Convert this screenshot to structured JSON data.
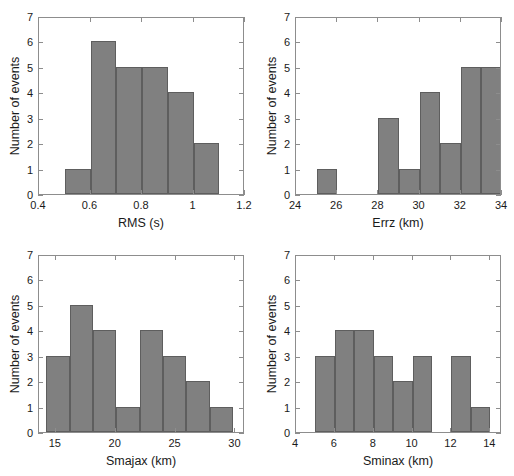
{
  "figure": {
    "name": "four-panel-histogram-figure",
    "background": "#ffffff",
    "bar_fill": "#808080",
    "bar_edge": "#5e5e5e",
    "axis_color": "#8d8d8d",
    "text_color": "#1a1a1a"
  },
  "chart_data": [
    {
      "type": "bar",
      "panel": "top-left",
      "title": "",
      "xlabel": "RMS (s)",
      "ylabel": "Number of events",
      "xlim": [
        0.4,
        1.2
      ],
      "ylim": [
        0,
        7
      ],
      "grid": false,
      "legend": "none",
      "xticks": [
        0.4,
        0.6,
        0.8,
        1,
        1.2
      ],
      "xticklabels": [
        "0.4",
        "0.6",
        "0.8",
        "1",
        "1.2"
      ],
      "yticks": [
        0,
        1,
        2,
        3,
        4,
        5,
        6,
        7
      ],
      "yticklabels": [
        "0",
        "1",
        "2",
        "3",
        "4",
        "5",
        "6",
        "7"
      ],
      "bin_edges": [
        0.5,
        0.6,
        0.7,
        0.8,
        0.9,
        1.0,
        1.1
      ],
      "bin_centers": [
        0.55,
        0.65,
        0.75,
        0.85,
        0.95,
        1.05
      ],
      "values": [
        1,
        6,
        5,
        5,
        4,
        2
      ]
    },
    {
      "type": "bar",
      "panel": "top-right",
      "title": "",
      "xlabel": "Errz (km)",
      "ylabel": "Number of events",
      "xlim": [
        24,
        34
      ],
      "ylim": [
        0,
        7
      ],
      "grid": false,
      "legend": "none",
      "xticks": [
        24,
        26,
        28,
        30,
        32,
        34
      ],
      "xticklabels": [
        "24",
        "26",
        "28",
        "30",
        "32",
        "34"
      ],
      "yticks": [
        0,
        1,
        2,
        3,
        4,
        5,
        6,
        7
      ],
      "yticklabels": [
        "0",
        "1",
        "2",
        "3",
        "4",
        "5",
        "6",
        "7"
      ],
      "bars": [
        {
          "x0": 25,
          "x1": 26,
          "value": 1
        },
        {
          "x0": 28,
          "x1": 29,
          "value": 3
        },
        {
          "x0": 29,
          "x1": 30,
          "value": 1
        },
        {
          "x0": 30,
          "x1": 31,
          "value": 4
        },
        {
          "x0": 31,
          "x1": 32,
          "value": 2
        },
        {
          "x0": 32,
          "x1": 33,
          "value": 5
        },
        {
          "x0": 33,
          "x1": 34,
          "value": 5
        }
      ]
    },
    {
      "type": "bar",
      "panel": "bottom-left",
      "title": "",
      "xlabel": "Smajax (km)",
      "ylabel": "Number of events",
      "xlim": [
        13.6,
        30.8
      ],
      "ylim": [
        0,
        7
      ],
      "grid": false,
      "legend": "none",
      "xticks": [
        15,
        20,
        25,
        30
      ],
      "xticklabels": [
        "15",
        "20",
        "25",
        "30"
      ],
      "yticks": [
        0,
        1,
        2,
        3,
        4,
        5,
        6,
        7
      ],
      "yticklabels": [
        "0",
        "1",
        "2",
        "3",
        "4",
        "5",
        "6",
        "7"
      ],
      "bars": [
        {
          "x0": 14.2,
          "x1": 16.15,
          "value": 3
        },
        {
          "x0": 16.15,
          "x1": 18.1,
          "value": 5
        },
        {
          "x0": 18.1,
          "x1": 20.05,
          "value": 4
        },
        {
          "x0": 20.05,
          "x1": 22.0,
          "value": 1
        },
        {
          "x0": 22.0,
          "x1": 23.95,
          "value": 4
        },
        {
          "x0": 23.95,
          "x1": 25.9,
          "value": 3
        },
        {
          "x0": 25.9,
          "x1": 27.85,
          "value": 2
        },
        {
          "x0": 27.85,
          "x1": 29.8,
          "value": 1
        }
      ]
    },
    {
      "type": "bar",
      "panel": "bottom-right",
      "title": "",
      "xlabel": "Sminax (km)",
      "ylabel": "Number of events",
      "xlim": [
        4,
        14.6
      ],
      "ylim": [
        0,
        7
      ],
      "grid": false,
      "legend": "none",
      "xticks": [
        4,
        6,
        8,
        10,
        12,
        14
      ],
      "xticklabels": [
        "4",
        "6",
        "8",
        "10",
        "12",
        "14"
      ],
      "yticks": [
        0,
        1,
        2,
        3,
        4,
        5,
        6,
        7
      ],
      "yticklabels": [
        "0",
        "1",
        "2",
        "3",
        "4",
        "5",
        "6",
        "7"
      ],
      "bars": [
        {
          "x0": 5,
          "x1": 6,
          "value": 3
        },
        {
          "x0": 6,
          "x1": 7,
          "value": 4
        },
        {
          "x0": 7,
          "x1": 8,
          "value": 4
        },
        {
          "x0": 8,
          "x1": 9,
          "value": 3
        },
        {
          "x0": 9,
          "x1": 10,
          "value": 2
        },
        {
          "x0": 10,
          "x1": 11,
          "value": 3
        },
        {
          "x0": 12,
          "x1": 13,
          "value": 3
        },
        {
          "x0": 13,
          "x1": 14,
          "value": 1
        }
      ]
    }
  ]
}
